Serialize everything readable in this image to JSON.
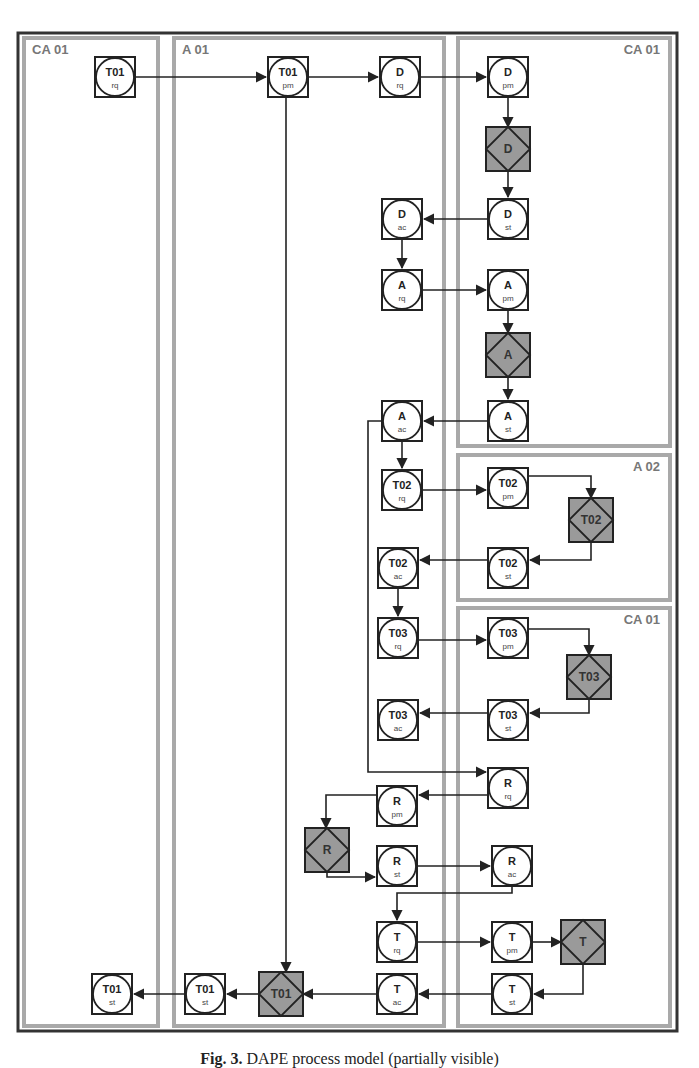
{
  "figure": {
    "caption_label": "Fig. 3.",
    "caption_text": "DAPE process model (partially visible)"
  },
  "lanes": [
    {
      "id": "lane-ca01-left",
      "label": "CA 01",
      "x": 24,
      "y": 38,
      "w": 134,
      "h": 988,
      "label_align": "left"
    },
    {
      "id": "lane-a01",
      "label": "A 01",
      "x": 174,
      "y": 38,
      "w": 270,
      "h": 988,
      "label_align": "left"
    },
    {
      "id": "lane-ca01-top",
      "label": "CA 01",
      "x": 458,
      "y": 38,
      "w": 212,
      "h": 408,
      "label_align": "right"
    },
    {
      "id": "lane-a02",
      "label": "A 02",
      "x": 458,
      "y": 455,
      "w": 212,
      "h": 145,
      "label_align": "right"
    },
    {
      "id": "lane-ca01-bottom",
      "label": "CA 01",
      "x": 458,
      "y": 608,
      "w": 212,
      "h": 418,
      "label_align": "right"
    }
  ],
  "nodes": [
    {
      "id": "t01-rq",
      "kind": "act",
      "top": "T01",
      "sub": "rq",
      "x": 115,
      "y": 77
    },
    {
      "id": "t01-pm",
      "kind": "act",
      "top": "T01",
      "sub": "pm",
      "x": 288,
      "y": 77
    },
    {
      "id": "d-rq",
      "kind": "act",
      "top": "D",
      "sub": "rq",
      "x": 400,
      "y": 77
    },
    {
      "id": "d-pm",
      "kind": "act",
      "top": "D",
      "sub": "pm",
      "x": 508,
      "y": 77
    },
    {
      "id": "d-ex",
      "kind": "exec",
      "top": "D",
      "x": 508,
      "y": 149
    },
    {
      "id": "d-st",
      "kind": "act",
      "top": "D",
      "sub": "st",
      "x": 508,
      "y": 219
    },
    {
      "id": "d-ac",
      "kind": "act",
      "top": "D",
      "sub": "ac",
      "x": 402,
      "y": 219
    },
    {
      "id": "a-rq",
      "kind": "act",
      "top": "A",
      "sub": "rq",
      "x": 402,
      "y": 290
    },
    {
      "id": "a-pm",
      "kind": "act",
      "top": "A",
      "sub": "pm",
      "x": 508,
      "y": 290
    },
    {
      "id": "a-ex",
      "kind": "exec",
      "top": "A",
      "x": 508,
      "y": 355
    },
    {
      "id": "a-st",
      "kind": "act",
      "top": "A",
      "sub": "st",
      "x": 508,
      "y": 421
    },
    {
      "id": "a-ac",
      "kind": "act",
      "top": "A",
      "sub": "ac",
      "x": 402,
      "y": 421
    },
    {
      "id": "t02-rq",
      "kind": "act",
      "top": "T02",
      "sub": "rq",
      "x": 402,
      "y": 490
    },
    {
      "id": "t02-pm",
      "kind": "act",
      "top": "T02",
      "sub": "pm",
      "x": 508,
      "y": 488
    },
    {
      "id": "t02-ex",
      "kind": "exec",
      "top": "T02",
      "x": 591,
      "y": 520
    },
    {
      "id": "t02-st",
      "kind": "act",
      "top": "T02",
      "sub": "st",
      "x": 508,
      "y": 568
    },
    {
      "id": "t02-ac",
      "kind": "act",
      "top": "T02",
      "sub": "ac",
      "x": 398,
      "y": 568
    },
    {
      "id": "t03-rq",
      "kind": "act",
      "top": "T03",
      "sub": "rq",
      "x": 398,
      "y": 638
    },
    {
      "id": "t03-pm",
      "kind": "act",
      "top": "T03",
      "sub": "pm",
      "x": 508,
      "y": 638
    },
    {
      "id": "t03-ex",
      "kind": "exec",
      "top": "T03",
      "x": 589,
      "y": 677
    },
    {
      "id": "t03-st",
      "kind": "act",
      "top": "T03",
      "sub": "st",
      "x": 508,
      "y": 720
    },
    {
      "id": "t03-ac",
      "kind": "act",
      "top": "T03",
      "sub": "ac",
      "x": 398,
      "y": 720
    },
    {
      "id": "r-rq",
      "kind": "act",
      "top": "R",
      "sub": "rq",
      "x": 508,
      "y": 788
    },
    {
      "id": "r-pm",
      "kind": "act",
      "top": "R",
      "sub": "pm",
      "x": 397,
      "y": 806
    },
    {
      "id": "r-ex",
      "kind": "exec",
      "top": "R",
      "x": 327,
      "y": 850
    },
    {
      "id": "r-st",
      "kind": "act",
      "top": "R",
      "sub": "st",
      "x": 397,
      "y": 866
    },
    {
      "id": "r-ac",
      "kind": "act",
      "top": "R",
      "sub": "ac",
      "x": 512,
      "y": 866
    },
    {
      "id": "t-rq",
      "kind": "act",
      "top": "T",
      "sub": "rq",
      "x": 397,
      "y": 942
    },
    {
      "id": "t-pm",
      "kind": "act",
      "top": "T",
      "sub": "pm",
      "x": 512,
      "y": 942
    },
    {
      "id": "t-ex",
      "kind": "exec",
      "top": "T",
      "x": 583,
      "y": 942
    },
    {
      "id": "t-st",
      "kind": "act",
      "top": "T",
      "sub": "st",
      "x": 512,
      "y": 994
    },
    {
      "id": "t-ac",
      "kind": "act",
      "top": "T",
      "sub": "ac",
      "x": 397,
      "y": 994
    },
    {
      "id": "t01-ex",
      "kind": "exec",
      "top": "T01",
      "x": 281,
      "y": 994
    },
    {
      "id": "t01-st-a01",
      "kind": "act",
      "top": "T01",
      "sub": "st",
      "x": 205,
      "y": 994
    },
    {
      "id": "t01-st-ca01",
      "kind": "act",
      "top": "T01",
      "sub": "st",
      "x": 112,
      "y": 994
    }
  ],
  "edges": [
    {
      "from": "t01-rq",
      "to": "t01-pm",
      "points": [
        [
          135,
          77
        ],
        [
          266,
          77
        ]
      ]
    },
    {
      "from": "t01-pm",
      "to": "d-rq",
      "points": [
        [
          308,
          77
        ],
        [
          378,
          77
        ]
      ]
    },
    {
      "from": "d-rq",
      "to": "d-pm",
      "points": [
        [
          420,
          77
        ],
        [
          486,
          77
        ]
      ]
    },
    {
      "from": "d-pm",
      "to": "d-ex",
      "points": [
        [
          508,
          97
        ],
        [
          508,
          127
        ]
      ]
    },
    {
      "from": "d-ex",
      "to": "d-st",
      "points": [
        [
          508,
          171
        ],
        [
          508,
          197
        ]
      ]
    },
    {
      "from": "d-st",
      "to": "d-ac",
      "points": [
        [
          488,
          219
        ],
        [
          424,
          219
        ]
      ]
    },
    {
      "from": "d-ac",
      "to": "a-rq",
      "points": [
        [
          402,
          239
        ],
        [
          402,
          268
        ]
      ]
    },
    {
      "from": "a-rq",
      "to": "a-pm",
      "points": [
        [
          422,
          290
        ],
        [
          486,
          290
        ]
      ]
    },
    {
      "from": "a-pm",
      "to": "a-ex",
      "points": [
        [
          508,
          310
        ],
        [
          508,
          333
        ]
      ]
    },
    {
      "from": "a-ex",
      "to": "a-st",
      "points": [
        [
          508,
          377
        ],
        [
          508,
          399
        ]
      ]
    },
    {
      "from": "a-st",
      "to": "a-ac",
      "points": [
        [
          488,
          421
        ],
        [
          424,
          421
        ]
      ]
    },
    {
      "from": "a-ac",
      "to": "t02-rq",
      "points": [
        [
          402,
          441
        ],
        [
          402,
          468
        ]
      ]
    },
    {
      "from": "t02-rq",
      "to": "t02-pm",
      "points": [
        [
          422,
          490
        ],
        [
          486,
          490
        ]
      ]
    },
    {
      "from": "t02-pm",
      "to": "t02-ex",
      "points": [
        [
          528,
          476
        ],
        [
          591,
          476
        ],
        [
          591,
          498
        ]
      ]
    },
    {
      "from": "t02-ex",
      "to": "t02-st",
      "points": [
        [
          591,
          542
        ],
        [
          591,
          560
        ],
        [
          530,
          560
        ]
      ]
    },
    {
      "from": "t02-st",
      "to": "t02-ac",
      "points": [
        [
          488,
          560
        ],
        [
          420,
          560
        ]
      ]
    },
    {
      "from": "t02-ac",
      "to": "t03-rq",
      "points": [
        [
          398,
          588
        ],
        [
          398,
          616
        ]
      ]
    },
    {
      "from": "t03-rq",
      "to": "t03-pm",
      "points": [
        [
          418,
          640
        ],
        [
          486,
          640
        ]
      ]
    },
    {
      "from": "t03-pm",
      "to": "t03-ex",
      "points": [
        [
          528,
          629
        ],
        [
          589,
          629
        ],
        [
          589,
          655
        ]
      ]
    },
    {
      "from": "t03-ex",
      "to": "t03-st",
      "points": [
        [
          589,
          699
        ],
        [
          589,
          713
        ],
        [
          530,
          713
        ]
      ]
    },
    {
      "from": "t03-st",
      "to": "t03-ac",
      "points": [
        [
          488,
          713
        ],
        [
          420,
          713
        ]
      ]
    },
    {
      "from": "a-ac",
      "to": "r-rq",
      "points": [
        [
          382,
          421
        ],
        [
          368,
          421
        ],
        [
          368,
          772
        ],
        [
          486,
          772
        ]
      ]
    },
    {
      "from": "r-rq",
      "to": "r-pm",
      "points": [
        [
          488,
          795
        ],
        [
          419,
          795
        ]
      ]
    },
    {
      "from": "r-pm",
      "to": "r-ex",
      "points": [
        [
          377,
          795
        ],
        [
          326,
          795
        ],
        [
          326,
          828
        ]
      ]
    },
    {
      "from": "r-ex",
      "to": "r-st",
      "points": [
        [
          327,
          872
        ],
        [
          327,
          877
        ],
        [
          375,
          877
        ]
      ]
    },
    {
      "from": "r-st",
      "to": "r-ac",
      "points": [
        [
          417,
          866
        ],
        [
          490,
          866
        ]
      ]
    },
    {
      "from": "r-ac",
      "to": "t-rq",
      "points": [
        [
          512,
          886
        ],
        [
          512,
          893
        ],
        [
          397,
          893
        ],
        [
          397,
          920
        ]
      ]
    },
    {
      "from": "t-rq",
      "to": "t-pm",
      "points": [
        [
          417,
          942
        ],
        [
          490,
          942
        ]
      ]
    },
    {
      "from": "t-pm",
      "to": "t-ex",
      "points": [
        [
          532,
          942
        ],
        [
          561,
          942
        ]
      ]
    },
    {
      "from": "t-ex",
      "to": "t-st",
      "points": [
        [
          583,
          964
        ],
        [
          583,
          994
        ],
        [
          534,
          994
        ]
      ]
    },
    {
      "from": "t-st",
      "to": "t-ac",
      "points": [
        [
          492,
          994
        ],
        [
          419,
          994
        ]
      ]
    },
    {
      "from": "t-ac",
      "to": "t01-ex",
      "points": [
        [
          377,
          994
        ],
        [
          303,
          994
        ]
      ]
    },
    {
      "from": "t01-pm",
      "to": "t01-ex",
      "points": [
        [
          286,
          97
        ],
        [
          286,
          972
        ]
      ]
    },
    {
      "from": "t01-ex",
      "to": "t01-st-a01",
      "points": [
        [
          259,
          994
        ],
        [
          227,
          994
        ]
      ]
    },
    {
      "from": "t01-st-a01",
      "to": "t01-st-ca01",
      "points": [
        [
          185,
          994
        ],
        [
          134,
          994
        ]
      ]
    }
  ],
  "colors": {
    "frame": "#333333",
    "lane_border": "#a9a9a9",
    "exec_fill": "#9a9a9a",
    "line": "#222222"
  }
}
